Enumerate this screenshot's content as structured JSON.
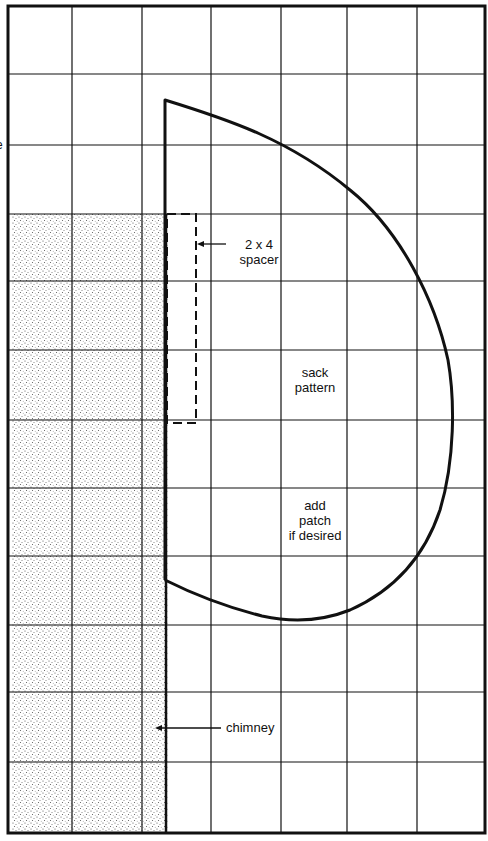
{
  "diagram": {
    "kind": "grid-pattern-drawing",
    "colors": {
      "ink": "#111111",
      "paper": "#ffffff",
      "stipple": "#555555"
    },
    "frame": {
      "left": 8,
      "top": 6,
      "right": 485,
      "bottom": 833
    },
    "grid": {
      "verticals": [
        8,
        72,
        142,
        211,
        281,
        347,
        417,
        485
      ],
      "horizontals": [
        6,
        74,
        145,
        214,
        281,
        350,
        420,
        488,
        556,
        625,
        692,
        762,
        833
      ]
    },
    "chimney": {
      "x": 12,
      "y": 214,
      "width": 156,
      "height": 619
    },
    "spacer": {
      "x": 167,
      "y": 214,
      "width": 29,
      "height": 209
    },
    "sack_path": "M165,580 L165,100 C230,120 290,140 350,190 C400,230 435,300 448,360 C455,400 455,460 440,510 C425,555 395,590 350,610 C320,622 290,622 262,616 C230,608 195,595 165,580",
    "edge_letter": "e"
  },
  "labels": {
    "spacer": [
      "2 x 4",
      "spacer"
    ],
    "sack": [
      "sack",
      "pattern"
    ],
    "patch": [
      "add",
      "patch",
      "if desired"
    ],
    "chimney": "chimney"
  }
}
